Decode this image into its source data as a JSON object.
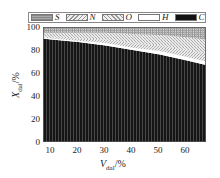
{
  "chart_data": {
    "type": "area",
    "title": "",
    "xlabel": "V_dal/%",
    "ylabel": "X_dal/%",
    "xlim": [
      7,
      67
    ],
    "ylim": [
      0,
      100
    ],
    "xticks": [
      10,
      20,
      30,
      40,
      50,
      60
    ],
    "yticks": [
      0,
      20,
      40,
      60,
      80,
      100
    ],
    "legend": [
      "S",
      "N",
      "O",
      "H",
      "C"
    ],
    "legend_position": "top",
    "stacked": true,
    "x": [
      7,
      10,
      20,
      30,
      40,
      50,
      60,
      67
    ],
    "series": [
      {
        "name": "C",
        "values": [
          90,
          89,
          87,
          84,
          80,
          76,
          71,
          67
        ]
      },
      {
        "name": "H",
        "values": [
          1,
          1,
          1,
          2,
          2,
          3,
          3,
          3
        ]
      },
      {
        "name": "O",
        "values": [
          1,
          1,
          2,
          3,
          4,
          5,
          6,
          7
        ]
      },
      {
        "name": "N",
        "values": [
          3,
          4,
          5,
          6,
          8,
          9,
          11,
          12
        ]
      },
      {
        "name": "S",
        "values": [
          5,
          5,
          5,
          5,
          6,
          7,
          9,
          11
        ]
      }
    ]
  },
  "legend": {
    "items": [
      {
        "key": "S",
        "label": "S"
      },
      {
        "key": "N",
        "label": "N"
      },
      {
        "key": "O",
        "label": "O"
      },
      {
        "key": "H",
        "label": "H"
      },
      {
        "key": "C",
        "label": "C"
      }
    ]
  },
  "axes": {
    "y_ticks": [
      "100",
      "80",
      "60",
      "40",
      "20",
      "0"
    ],
    "x_ticks": [
      "10",
      "20",
      "30",
      "40",
      "50",
      "60"
    ],
    "y_label_main": "X",
    "y_label_sub": "dal",
    "y_label_unit": "/%",
    "x_label_main": "V",
    "x_label_sub": "dal",
    "x_label_unit": "/%"
  }
}
